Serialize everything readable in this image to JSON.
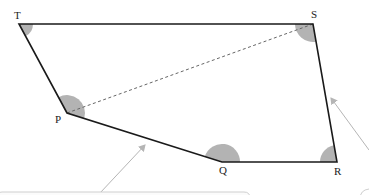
{
  "diagram": {
    "type": "quadrilateral-pentagon",
    "vertices": {
      "T": {
        "label": "T",
        "x": 19,
        "y": 24
      },
      "S": {
        "label": "S",
        "x": 313,
        "y": 24
      },
      "R": {
        "label": "R",
        "x": 337,
        "y": 162
      },
      "Q": {
        "label": "Q",
        "x": 222,
        "y": 162
      },
      "P": {
        "label": "P",
        "x": 67,
        "y": 113
      }
    },
    "edges": [
      "T-S",
      "S-R",
      "R-Q",
      "Q-P",
      "P-T"
    ],
    "diagonal": {
      "from": "P",
      "to": "S",
      "style": "dashed"
    },
    "shaded_angles": [
      "T",
      "S",
      "R",
      "Q",
      "P"
    ],
    "colors": {
      "edge": "#1a1a1a",
      "angle_fill": "#b3b3b3",
      "dashed": "#666666",
      "callout": "#bdbdbd"
    },
    "callouts": [
      {
        "id": "callout-left",
        "arrow_from": [
          100,
          193
        ],
        "arrow_to": [
          145,
          145
        ]
      },
      {
        "id": "callout-right",
        "arrow_from": [
          369,
          150
        ],
        "arrow_to": [
          331,
          98
        ]
      }
    ]
  }
}
